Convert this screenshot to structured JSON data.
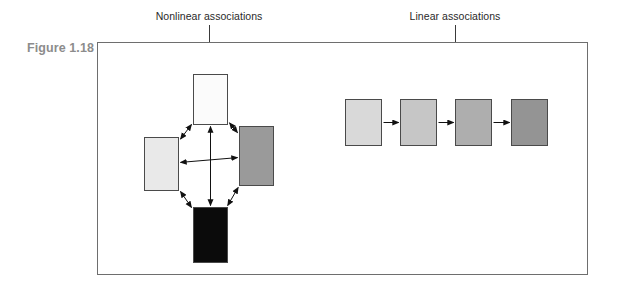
{
  "figure": {
    "number_label": "Figure 1.18",
    "frame_color": "#6e6e6e",
    "number_color": "#8c8c8c"
  },
  "callouts": [
    {
      "id": "nonlinear",
      "text": "Nonlinear associations",
      "line_x": 209,
      "line_top": 25,
      "line_height": 48
    },
    {
      "id": "linear",
      "text": "Linear associations",
      "line_x": 455,
      "line_top": 25,
      "line_height": 65
    }
  ],
  "diagram": {
    "type": "node-link",
    "nonlinear_cluster": {
      "name": "Nonlinear associations",
      "arrow_style": "double-headed",
      "nodes": [
        {
          "id": "top",
          "fill": "#fbfbfb",
          "x": 193,
          "y": 74,
          "w": 35,
          "h": 51
        },
        {
          "id": "left",
          "fill": "#e9e9e9",
          "x": 144,
          "y": 137,
          "w": 35,
          "h": 54
        },
        {
          "id": "right",
          "fill": "#9a9a9a",
          "x": 239,
          "y": 126,
          "w": 35,
          "h": 60
        },
        {
          "id": "bottom",
          "fill": "#0b0b0b",
          "x": 193,
          "y": 207,
          "w": 35,
          "h": 56
        }
      ],
      "edges": [
        {
          "from": "top",
          "to": "left"
        },
        {
          "from": "top",
          "to": "right"
        },
        {
          "from": "top",
          "to": "bottom"
        },
        {
          "from": "left",
          "to": "right"
        },
        {
          "from": "left",
          "to": "bottom"
        },
        {
          "from": "right",
          "to": "bottom"
        }
      ]
    },
    "linear_chain": {
      "name": "Linear associations",
      "arrow_style": "single-headed",
      "nodes": [
        {
          "id": "step-1",
          "fill": "#d9d9d9",
          "x": 345,
          "y": 99,
          "w": 37,
          "h": 47
        },
        {
          "id": "step-2",
          "fill": "#c6c6c6",
          "x": 400,
          "y": 99,
          "w": 37,
          "h": 47
        },
        {
          "id": "step-3",
          "fill": "#aeaeae",
          "x": 455,
          "y": 99,
          "w": 37,
          "h": 47
        },
        {
          "id": "step-4",
          "fill": "#949494",
          "x": 511,
          "y": 99,
          "w": 37,
          "h": 47
        }
      ],
      "edges": [
        {
          "from": "step-1",
          "to": "step-2"
        },
        {
          "from": "step-2",
          "to": "step-3"
        },
        {
          "from": "step-3",
          "to": "step-4"
        }
      ]
    }
  }
}
